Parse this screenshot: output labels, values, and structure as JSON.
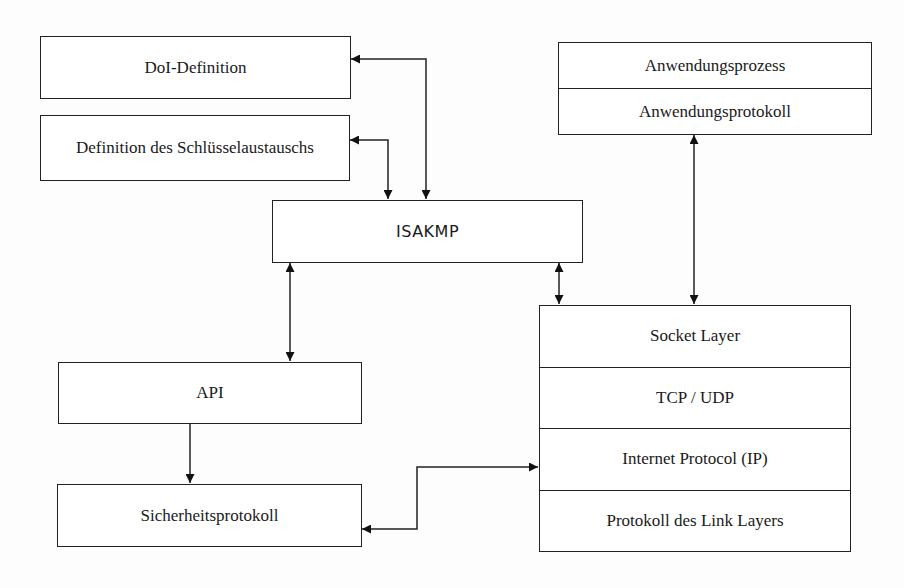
{
  "diagram": {
    "boxes": {
      "doi": "DoI-Definition",
      "key_exchange": "Definition des Schlüsselaustauschs",
      "isakmp": "ISAKMP",
      "api": "API",
      "security_protocol": "Sicherheitsprotokoll"
    },
    "application_stack": [
      "Anwendungsprozess",
      "Anwendungsprotokoll"
    ],
    "network_stack": [
      "Socket Layer",
      "TCP / UDP",
      "Internet Protocol (IP)",
      "Protokoll des Link Layers"
    ],
    "connections": [
      {
        "from": "DoI-Definition",
        "to": "ISAKMP",
        "type": "bidirectional"
      },
      {
        "from": "Definition des Schlüsselaustauschs",
        "to": "ISAKMP",
        "type": "bidirectional"
      },
      {
        "from": "ISAKMP",
        "to": "API",
        "type": "bidirectional"
      },
      {
        "from": "ISAKMP",
        "to": "Socket Layer",
        "type": "bidirectional"
      },
      {
        "from": "Anwendungsprotokoll",
        "to": "Socket Layer",
        "type": "bidirectional"
      },
      {
        "from": "API",
        "to": "Sicherheitsprotokoll",
        "type": "directed"
      },
      {
        "from": "Sicherheitsprotokoll",
        "to": "Internet Protocol (IP)",
        "type": "bidirectional"
      }
    ]
  }
}
